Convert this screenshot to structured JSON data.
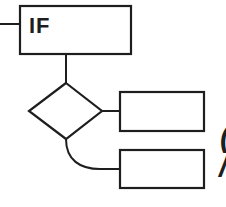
{
  "diagram": {
    "type": "flowchart",
    "nodes": [
      {
        "id": "if-block",
        "shape": "rectangle",
        "label": "IF"
      },
      {
        "id": "decision",
        "shape": "diamond",
        "label": ""
      },
      {
        "id": "branch-true",
        "shape": "rectangle",
        "label": ""
      },
      {
        "id": "branch-false",
        "shape": "rectangle",
        "label": ""
      }
    ],
    "edges": [
      {
        "from": "incoming",
        "to": "if-block"
      },
      {
        "from": "if-block",
        "to": "decision"
      },
      {
        "from": "decision",
        "to": "branch-true"
      },
      {
        "from": "decision",
        "to": "branch-false",
        "style": "curved"
      }
    ],
    "clipped_right_edge_glyphs": [
      "(",
      "/"
    ]
  },
  "colors": {
    "stroke": "#1e1e1e",
    "background": "#ffffff"
  }
}
